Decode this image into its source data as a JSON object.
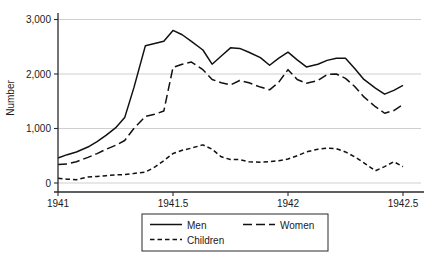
{
  "chart_data": {
    "type": "line",
    "title": "",
    "xlabel": "",
    "ylabel": "Number",
    "xlim": [
      1941.0,
      1942.55
    ],
    "ylim": [
      0,
      3000
    ],
    "grid": true,
    "legend_position": "bottom",
    "x_ticks": [
      "1941",
      "1941.5",
      "1942",
      "1942.5"
    ],
    "x_tick_values": [
      1941,
      1941.5,
      1942,
      1942.5
    ],
    "y_ticks": [
      "0",
      "1,000",
      "2,000",
      "3,000"
    ],
    "y_tick_values": [
      0,
      1000,
      2000,
      3000
    ],
    "x": [
      1941.0,
      1941.04,
      1941.08,
      1941.13,
      1941.17,
      1941.21,
      1941.25,
      1941.29,
      1941.33,
      1941.38,
      1941.42,
      1941.46,
      1941.5,
      1941.54,
      1941.58,
      1941.63,
      1941.67,
      1941.71,
      1941.75,
      1941.79,
      1941.83,
      1941.88,
      1941.92,
      1941.96,
      1942.0,
      1942.04,
      1942.08,
      1942.13,
      1942.17,
      1942.21,
      1942.25,
      1942.29,
      1942.33,
      1942.38,
      1942.42,
      1942.46,
      1942.5
    ],
    "series": [
      {
        "name": "Men",
        "style": "solid",
        "values": [
          460,
          520,
          570,
          660,
          760,
          880,
          1010,
          1200,
          1750,
          2520,
          2560,
          2600,
          2800,
          2720,
          2600,
          2440,
          2180,
          2330,
          2480,
          2470,
          2400,
          2300,
          2160,
          2290,
          2400,
          2260,
          2130,
          2180,
          2250,
          2290,
          2290,
          2100,
          1900,
          1740,
          1630,
          1700,
          1790
        ]
      },
      {
        "name": "Women",
        "style": "long-dash",
        "values": [
          340,
          350,
          390,
          470,
          540,
          620,
          690,
          780,
          1000,
          1220,
          1260,
          1320,
          2120,
          2180,
          2220,
          2080,
          1900,
          1840,
          1800,
          1880,
          1840,
          1760,
          1710,
          1850,
          2080,
          1900,
          1830,
          1880,
          1990,
          2000,
          1920,
          1770,
          1580,
          1400,
          1280,
          1330,
          1440
        ]
      },
      {
        "name": "Children",
        "style": "short-dash",
        "values": [
          85,
          70,
          60,
          110,
          120,
          135,
          150,
          155,
          175,
          200,
          290,
          410,
          540,
          600,
          640,
          700,
          620,
          480,
          430,
          430,
          390,
          380,
          390,
          410,
          440,
          500,
          570,
          620,
          640,
          630,
          570,
          480,
          370,
          225,
          300,
          390,
          300
        ]
      }
    ]
  },
  "legend": {
    "entries": [
      {
        "label": "Men",
        "style": "solid"
      },
      {
        "label": "Women",
        "style": "long-dash"
      },
      {
        "label": "Children",
        "style": "short-dash"
      }
    ]
  }
}
